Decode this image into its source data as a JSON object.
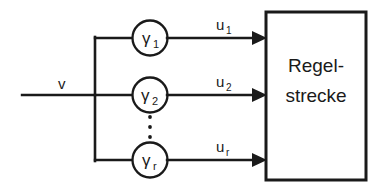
{
  "diagram": {
    "type": "control-block-diagram",
    "language": "de",
    "background_color": "#ffffff",
    "line_color": "#1a1a1a",
    "input": {
      "label": "v",
      "name": "input-signal-v"
    },
    "gain_blocks": [
      {
        "symbol": "γ",
        "subscript": "1",
        "name": "gain-gamma-1"
      },
      {
        "symbol": "γ",
        "subscript": "2",
        "name": "gain-gamma-2"
      },
      {
        "symbol": "γ",
        "subscript": "r",
        "name": "gain-gamma-r"
      }
    ],
    "ellipsis": {
      "label": "⋮",
      "dot_count": 3,
      "name": "vertical-ellipsis"
    },
    "output_signals": [
      {
        "symbol": "u",
        "subscript": "1",
        "name": "signal-u-1"
      },
      {
        "symbol": "u",
        "subscript": "2",
        "name": "signal-u-2"
      },
      {
        "symbol": "u",
        "subscript": "r",
        "name": "signal-u-r"
      }
    ],
    "plant": {
      "line1": "Regel-",
      "line2": "strecke",
      "name": "plant-block"
    }
  }
}
